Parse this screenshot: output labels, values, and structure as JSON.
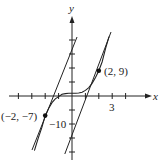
{
  "diagram": {
    "function": "y = x^3 + 1",
    "axes": {
      "x_label": "x",
      "y_label": "y"
    },
    "tick_labels": {
      "x": "3",
      "y": "−10"
    },
    "points": [
      {
        "label": "(2, 9)",
        "x": 2,
        "y": 9
      },
      {
        "label": "(−2, −7)",
        "x": -2,
        "y": -7
      }
    ],
    "tangent_lines": [
      {
        "through": "(2, 9)",
        "slope": 12
      },
      {
        "through": "(−2, −7)",
        "slope": 12
      }
    ],
    "colors": {
      "ink": "#222222",
      "background": "#ffffff"
    }
  }
}
